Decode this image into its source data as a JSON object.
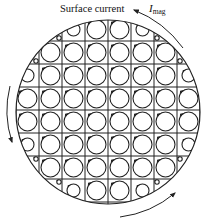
{
  "figure": {
    "label_surface_current": "Surface current",
    "label_current_symbol": "I",
    "label_current_subscript": "mag",
    "boundary": {
      "cx": 108,
      "cy": 112,
      "r": 92
    },
    "grid": {
      "x0": 16,
      "y0": 18,
      "cell": 23,
      "rows": 8,
      "cols": 8,
      "line_color": "#222222"
    },
    "cells": [
      [
        "none",
        "tiny-br",
        "small",
        "full",
        "full",
        "small",
        "tiny-bl",
        "none"
      ],
      [
        "tiny-br",
        "full",
        "full",
        "full",
        "full",
        "full",
        "full",
        "tiny-bl"
      ],
      [
        "small",
        "full",
        "full",
        "full",
        "full",
        "full",
        "full",
        "small"
      ],
      [
        "full",
        "full",
        "full",
        "full",
        "full",
        "full",
        "full",
        "full"
      ],
      [
        "full",
        "full",
        "full",
        "full",
        "full",
        "full",
        "full",
        "full"
      ],
      [
        "small",
        "full",
        "full",
        "full",
        "full",
        "full",
        "full",
        "small"
      ],
      [
        "tiny-tr",
        "full",
        "full",
        "full",
        "full",
        "full",
        "full",
        "tiny-tl"
      ],
      [
        "none",
        "tiny-tr",
        "small",
        "full",
        "full",
        "small",
        "tiny-tl",
        "none"
      ]
    ],
    "arrows": [
      {
        "name": "top-right-arrow",
        "direction": "counterclockwise",
        "position": "top-right"
      },
      {
        "name": "left-arrow",
        "direction": "down",
        "position": "left"
      },
      {
        "name": "bottom-right-arrow",
        "direction": "up-right",
        "position": "bottom-right"
      }
    ],
    "stroke_color": "#222222"
  }
}
